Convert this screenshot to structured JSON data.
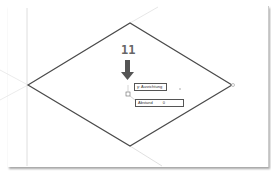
{
  "step_number": "11",
  "tooltip_input": {
    "label": "y: Ausrichtung"
  },
  "distance_input": {
    "label": "Abstand",
    "value": "0"
  },
  "colors": {
    "line": "#555555",
    "arrow": "#555555",
    "guide": "#d0d0d0"
  }
}
